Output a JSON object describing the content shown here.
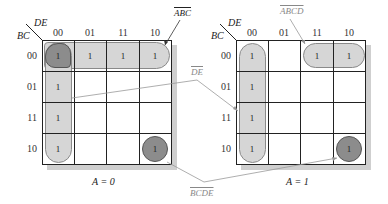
{
  "maps": [
    {
      "caption": "A = 0",
      "col_var": "DE",
      "row_var": "BC",
      "col_headers": [
        "00",
        "01",
        "11",
        "10"
      ],
      "row_headers": [
        "00",
        "01",
        "11",
        "10"
      ],
      "cells": [
        [
          "1",
          "1",
          "1",
          "1"
        ],
        [
          "1",
          "",
          "",
          ""
        ],
        [
          "1",
          "",
          "",
          ""
        ],
        [
          "1",
          "",
          "",
          "1"
        ]
      ]
    },
    {
      "caption": "A = 1",
      "col_var": "DE",
      "row_var": "BC",
      "col_headers": [
        "00",
        "01",
        "11",
        "10"
      ],
      "row_headers": [
        "00",
        "01",
        "11",
        "10"
      ],
      "cells": [
        [
          "1",
          "",
          "1",
          "1"
        ],
        [
          "1",
          "",
          "",
          ""
        ],
        [
          "1",
          "",
          "",
          ""
        ],
        [
          "1",
          "",
          "",
          "1"
        ]
      ]
    }
  ],
  "annotations": {
    "abc_bar": "ABC",
    "de_bar": "DE",
    "abcd": "ABCD",
    "bcde": "BCDE"
  },
  "colors": {
    "group_light": "#d6d6d6",
    "group_dark": "#8c8c8c",
    "shadow": "#cfcfcf",
    "grid": "#222222",
    "annotation": "#888888"
  }
}
